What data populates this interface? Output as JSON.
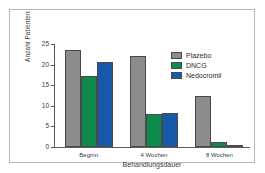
{
  "chart_data": {
    "type": "bar",
    "title": "",
    "xlabel": "Behandlungsdauer",
    "ylabel": "Anzahl Patienten",
    "categories": [
      "Beginn",
      "4 Wochen",
      "8 Wochen"
    ],
    "series": [
      {
        "name": "Plazebo",
        "color": "#8c8c8c",
        "values": [
          23.5,
          22.0,
          12.5
        ]
      },
      {
        "name": "DNCG",
        "color": "#0f8a4d",
        "values": [
          17.2,
          8.1,
          1.2
        ]
      },
      {
        "name": "Nedocromil",
        "color": "#1659a8",
        "values": [
          20.6,
          8.3,
          0.6
        ]
      }
    ],
    "ylim": [
      0,
      25
    ],
    "yticks": [
      0,
      5,
      10,
      15,
      20,
      25
    ],
    "ytick_labels": [
      "0",
      "5",
      "10",
      "15",
      "20",
      "25"
    ],
    "grid": false,
    "legend_position": "top-right",
    "axis_color": "#5a5a5a",
    "bar_border_color": "#4a4a4a",
    "frame_color": "#b9b9b9",
    "background_color": "#ffffff"
  }
}
